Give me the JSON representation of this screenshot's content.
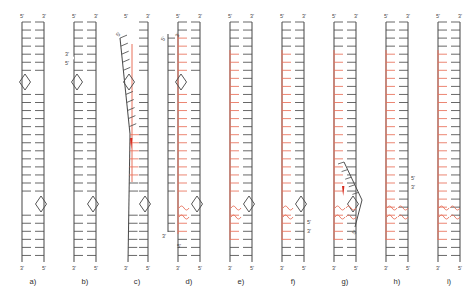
{
  "figure": {
    "type": "molecular-biology-schematic",
    "panel_count": 9,
    "colors": {
      "dna_black": "#4d4d4d",
      "rna_red": "#e8705a",
      "label_gray": "#4a4a4a",
      "arrow_red": "#d62b1f"
    },
    "legend_notes": {
      "black_strand": "DNA strand (black rungs)",
      "red_strand": "RNA / newly synthesized strand (red rungs)",
      "diamond": "open bubble / D-loop junction",
      "squiggle": "wavy mismatch / flexible region"
    }
  },
  "labels": {
    "five_prime": "5'",
    "three_prime": "3'"
  },
  "panels": [
    {
      "id": "a",
      "name": "a)",
      "top_left": "5'",
      "top_right": "3'",
      "bottom_left": "3'",
      "bottom_right": "5'",
      "red_strand": false,
      "diamonds": 2,
      "squiggles": 0,
      "branch": false,
      "nick_labels": []
    },
    {
      "id": "b",
      "name": "b)",
      "top_left": "5'",
      "top_right": "3'",
      "bottom_left": "3'",
      "bottom_right": "5'",
      "red_strand": false,
      "diamonds": 2,
      "squiggles": 0,
      "branch": false,
      "nick_labels": [
        "3'",
        "5'"
      ]
    },
    {
      "id": "c",
      "name": "c)",
      "top_left": "5'",
      "top_right": "3'",
      "bottom_left": "3'",
      "bottom_right": "5'",
      "red_strand": true,
      "diamonds": 2,
      "squiggles": 0,
      "branch": true,
      "branch_label": "5'",
      "arrowhead": true,
      "nick_labels": []
    },
    {
      "id": "d",
      "name": "d)",
      "top_left": "5'",
      "top_right": "3'",
      "bottom_left": "3'",
      "bottom_right": "5'",
      "red_strand": true,
      "diamonds": 2,
      "squiggles": 1,
      "branch": false,
      "nick_labels": [
        "5'",
        "3'",
        "3'",
        "5'"
      ]
    },
    {
      "id": "e",
      "name": "e)",
      "top_left": "5'",
      "top_right": "3'",
      "bottom_left": "3'",
      "bottom_right": "5'",
      "red_strand": true,
      "diamonds": 1,
      "squiggles": 1,
      "branch": false,
      "nick_labels": []
    },
    {
      "id": "f",
      "name": "f)",
      "top_left": "5'",
      "top_right": "3'",
      "bottom_left": "3'",
      "bottom_right": "5'",
      "red_strand": true,
      "diamonds": 1,
      "squiggles": 1,
      "branch": false,
      "nick_labels": [
        "5'",
        "3'"
      ]
    },
    {
      "id": "g",
      "name": "g)",
      "top_left": "5'",
      "top_right": "3'",
      "bottom_left": "3'",
      "bottom_right": "5'",
      "red_strand": true,
      "diamonds": 1,
      "squiggles": 2,
      "branch": true,
      "branch_label": "5'",
      "arrowhead": true,
      "nick_labels": []
    },
    {
      "id": "h",
      "name": "h)",
      "top_left": "5'",
      "top_right": "3'",
      "bottom_left": "3'",
      "bottom_right": "5'",
      "red_strand": true,
      "diamonds": 0,
      "squiggles": 2,
      "branch": false,
      "nick_labels": [
        "5'",
        "3'"
      ]
    },
    {
      "id": "i",
      "name": "i)",
      "top_left": "5'",
      "top_right": "3'",
      "bottom_left": "3'",
      "bottom_right": "5'",
      "red_strand": true,
      "diamonds": 0,
      "squiggles": 2,
      "branch": false,
      "nick_labels": []
    }
  ],
  "caption": {
    "cut_off_text": ""
  }
}
